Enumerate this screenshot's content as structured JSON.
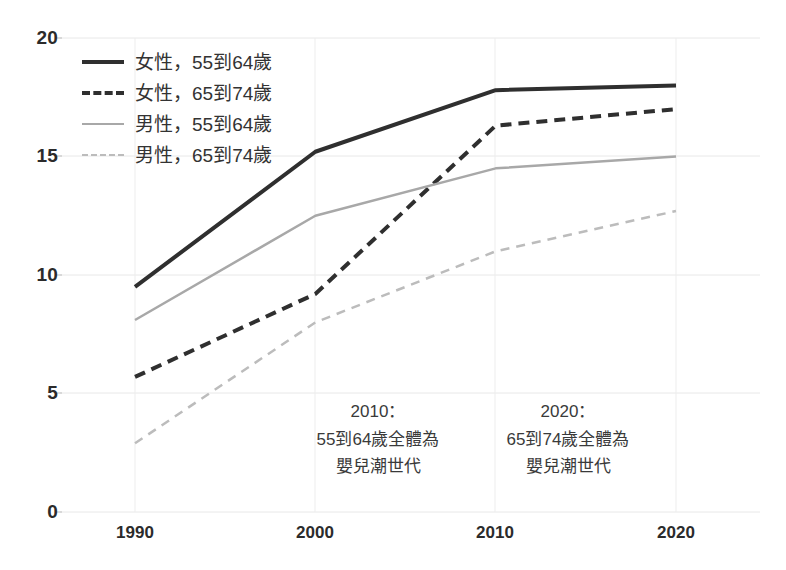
{
  "chart_data": {
    "type": "line",
    "title": "",
    "xlabel": "",
    "ylabel": "",
    "x": [
      1990,
      2000,
      2010,
      2020
    ],
    "xticklabels": [
      "1990",
      "2000",
      "2010",
      "2020"
    ],
    "yticklabels": [
      "0",
      "5",
      "10",
      "15",
      "20"
    ],
    "yticks": [
      0,
      5,
      10,
      15,
      20
    ],
    "ylim": [
      0,
      20
    ],
    "xlim": [
      1990,
      2020
    ],
    "grid": true,
    "legend_position": "upper left",
    "series": [
      {
        "name": "女性，55到64歲",
        "values": [
          9.5,
          15.2,
          17.8,
          18.0
        ],
        "color": "#2f2f2f",
        "style": "solid",
        "width": 4
      },
      {
        "name": "女性，65到74歲",
        "values": [
          5.7,
          9.2,
          16.3,
          17.0
        ],
        "color": "#2f2f2f",
        "style": "dashed",
        "width": 4
      },
      {
        "name": "男性，55到64歲",
        "values": [
          8.1,
          12.5,
          14.5,
          15.0
        ],
        "color": "#a8a8a8",
        "style": "solid",
        "width": 2.5
      },
      {
        "name": "男性，65到74歲",
        "values": [
          2.9,
          8.0,
          11.0,
          12.7
        ],
        "color": "#bcbcbc",
        "style": "dashed",
        "width": 2.5
      }
    ],
    "annotations": [
      {
        "at_x": 2010,
        "lines": [
          "2010：",
          "55到64歲全體為",
          "嬰兒潮世代"
        ]
      },
      {
        "at_x": 2020,
        "lines": [
          "2020：",
          "65到74歲全體為",
          "嬰兒潮世代"
        ]
      }
    ]
  },
  "legend": {
    "items": [
      {
        "label": "女性，55到64歲"
      },
      {
        "label": "女性，65到74歲"
      },
      {
        "label": "男性，55到64歲"
      },
      {
        "label": "男性，65到74歲"
      }
    ]
  },
  "axes": {
    "y": {
      "labels": [
        "20",
        "15",
        "10",
        "5",
        "0"
      ]
    },
    "x": {
      "labels": [
        "1990",
        "2000",
        "2010",
        "2020"
      ]
    }
  },
  "annotations": {
    "a2010": {
      "l1": "2010：",
      "l2": "55到64歲全體為",
      "l3": "嬰兒潮世代"
    },
    "a2020": {
      "l1": "2020：",
      "l2": "65到74歲全體為",
      "l3": "嬰兒潮世代"
    }
  },
  "colors": {
    "female_5564": "#2f2f2f",
    "female_6574": "#2f2f2f",
    "male_5564": "#a8a8a8",
    "male_6574": "#bcbcbc",
    "grid": "#e8e8e8",
    "text": "#2b2b2b"
  }
}
